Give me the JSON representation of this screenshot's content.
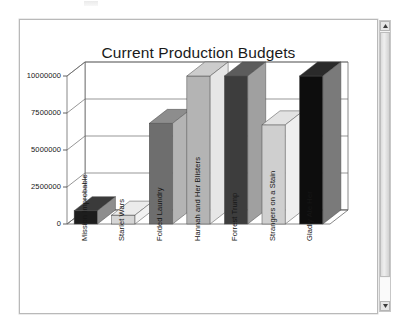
{
  "window": {
    "scrollbar": {
      "up_arrow_icon": "caret-up-icon",
      "down_arrow_icon": "caret-down-icon"
    }
  },
  "chart_data": {
    "type": "bar",
    "title": "Current Production Budgets",
    "xlabel": "",
    "ylabel": "",
    "ylim": [
      0,
      10000000
    ],
    "grid": true,
    "legend": false,
    "three_d": true,
    "annotations": [
      {
        "text": "13000000",
        "position": "above-plot-center"
      }
    ],
    "ytick_labels": [
      "0",
      "2500000",
      "5000000",
      "7500000",
      "10000000"
    ],
    "ytick_values": [
      0,
      2500000,
      5000000,
      7500000,
      10000000
    ],
    "categories": [
      "Mission Improbable",
      "Starlet Wars",
      "Folded Laundry",
      "Hannah and Her Blisters",
      "Forrest Trump",
      "Strangers on a Stain",
      "Gladly Ate Her"
    ],
    "values": [
      900000,
      600000,
      6800000,
      13000000,
      13000000,
      6700000,
      13000000
    ],
    "bar_colors": [
      "#1d1d1d",
      "#d6d6d6",
      "#6e6e6e",
      "#b4b4b4",
      "#3d3d3d",
      "#cfcfcf",
      "#0d0d0d"
    ],
    "bar_top_colors": [
      "#3a3a3a",
      "#ebebeb",
      "#8d8d8d",
      "#cccccc",
      "#5c5c5c",
      "#e2e2e2",
      "#2a2a2a"
    ],
    "bar_side_colors": [
      "#8d8d8d",
      "#f2f2f2",
      "#b4b4b4",
      "#e6e6e6",
      "#a0a0a0",
      "#efefef",
      "#7a7a7a"
    ]
  }
}
